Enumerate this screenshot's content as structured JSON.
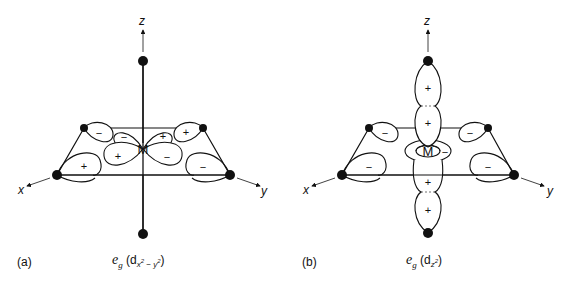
{
  "panels": [
    {
      "id": "a",
      "label": "(a)",
      "caption": {
        "symmetry": "e",
        "symmetry_sub": "g",
        "orbital": "d",
        "orbital_sub": "x2 − y2",
        "orbital_sub_parts": [
          "x",
          "2",
          " − ",
          "y",
          "2"
        ]
      },
      "axes": {
        "x": "x",
        "y": "y",
        "z": "z"
      },
      "center": "M",
      "lobe_signs": {
        "back_left_ligand": "−",
        "back_left_metal": "−",
        "back_right_metal": "+",
        "back_right_ligand": "+",
        "front_left_ligand": "+",
        "front_left_metal": "+",
        "front_right_metal": "−",
        "front_right_ligand": "−"
      }
    },
    {
      "id": "b",
      "label": "(b)",
      "caption": {
        "symmetry": "e",
        "symmetry_sub": "g",
        "orbital": "d",
        "orbital_sub": "z2",
        "orbital_sub_parts": [
          "z",
          "2"
        ]
      },
      "axes": {
        "x": "x",
        "y": "y",
        "z": "z"
      },
      "center": "M",
      "lobe_signs": {
        "top_ligand": "+",
        "top_metal": "+",
        "bottom_metal": "+",
        "bottom_ligand": "+",
        "torus": "−",
        "back_left_ligand": "−",
        "back_right_ligand": "−",
        "front_left_ligand": "−",
        "front_right_ligand": "−"
      }
    }
  ],
  "colors": {
    "ink": "#111111",
    "background": "#ffffff"
  }
}
